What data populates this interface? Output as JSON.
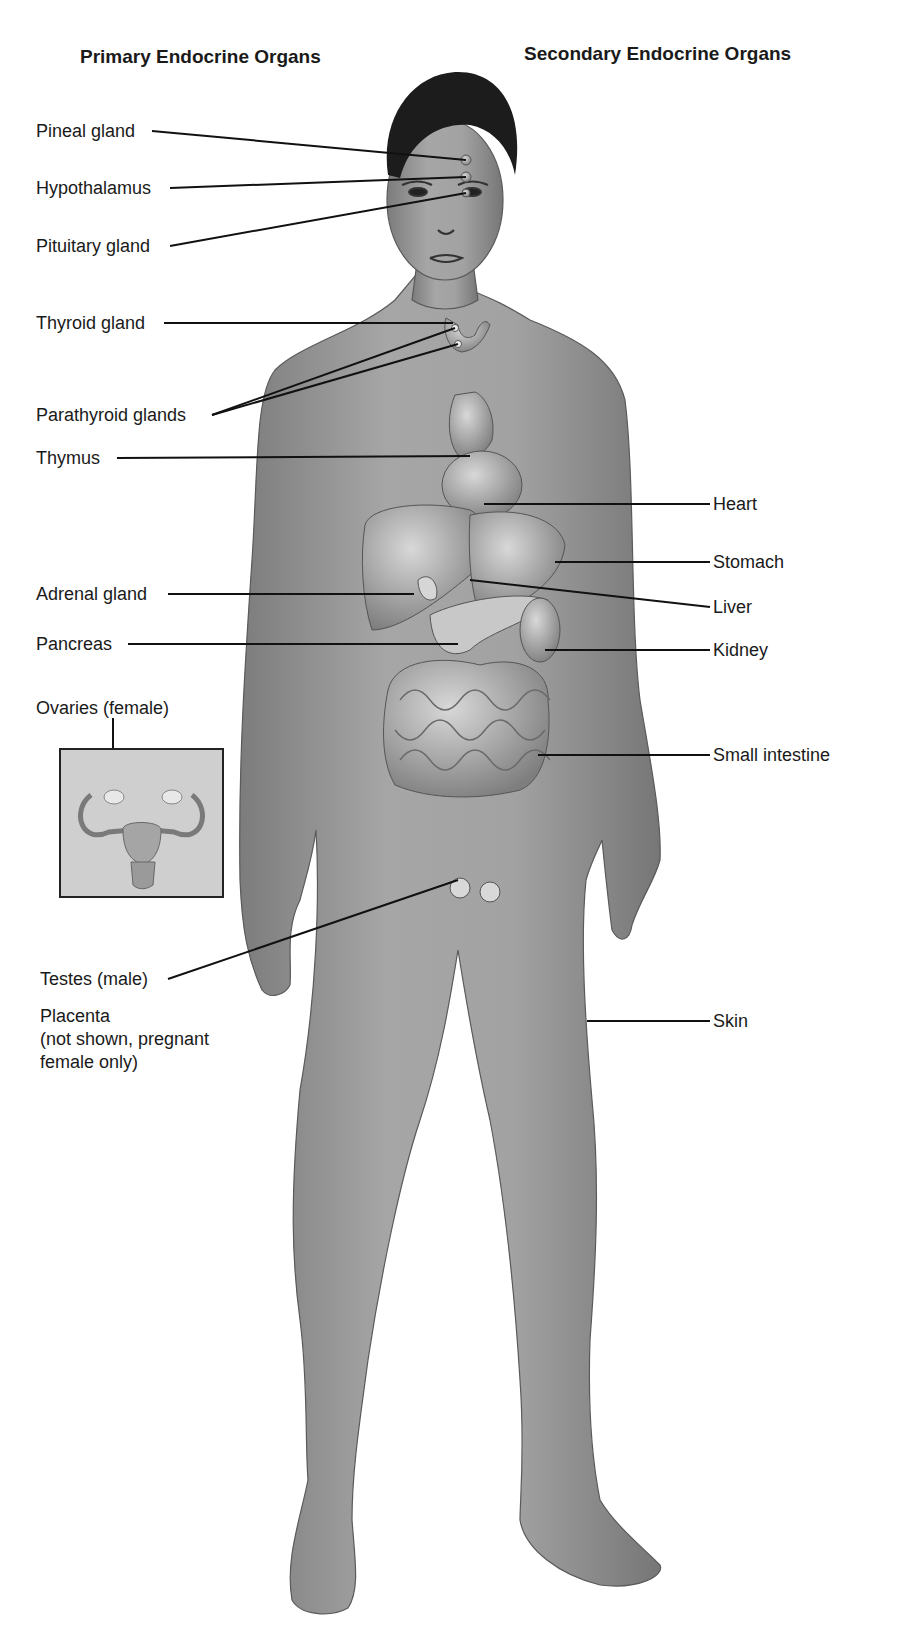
{
  "figure": {
    "headings": {
      "primary": "Primary Endocrine Organs",
      "secondary": "Secondary Endocrine Organs"
    },
    "primary_labels": [
      {
        "id": "pineal",
        "text": "Pineal gland"
      },
      {
        "id": "hypothalamus",
        "text": "Hypothalamus"
      },
      {
        "id": "pituitary",
        "text": "Pituitary gland"
      },
      {
        "id": "thyroid",
        "text": "Thyroid gland"
      },
      {
        "id": "parathyroid",
        "text": "Parathyroid glands"
      },
      {
        "id": "thymus",
        "text": "Thymus"
      },
      {
        "id": "adrenal",
        "text": "Adrenal gland"
      },
      {
        "id": "pancreas",
        "text": "Pancreas"
      },
      {
        "id": "ovaries",
        "text": "Ovaries (female)"
      },
      {
        "id": "testes",
        "text": "Testes (male)"
      },
      {
        "id": "placenta",
        "text": "Placenta",
        "note_line1": "(not shown, pregnant",
        "note_line2": "female only)"
      }
    ],
    "secondary_labels": [
      {
        "id": "heart",
        "text": "Heart"
      },
      {
        "id": "stomach",
        "text": "Stomach"
      },
      {
        "id": "liver",
        "text": "Liver"
      },
      {
        "id": "kidney",
        "text": "Kidney"
      },
      {
        "id": "small_intestine",
        "text": "Small intestine"
      },
      {
        "id": "skin",
        "text": "Skin"
      }
    ],
    "inset": {
      "subject": "female reproductive organs (uterus with ovaries)"
    },
    "illustration": {
      "subject": "anterior view of male human body with endocrine organs shown"
    },
    "colors": {
      "skin": "#9a9a9a",
      "hair": "#1c1c1c",
      "organ": "#b4b4b4",
      "line": "#111111"
    }
  }
}
